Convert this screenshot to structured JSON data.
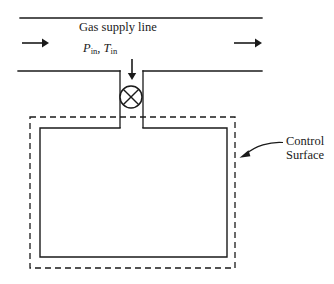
{
  "figure": {
    "type": "engineering-schematic",
    "background_color": "#ffffff",
    "line_color": "#1a1a1a"
  },
  "labels": {
    "supply_line": "Gas supply line",
    "inlet_pressure_symbol": "P",
    "inlet_pressure_subscript": "in",
    "symbol_separator": ", ",
    "inlet_temperature_symbol": "T",
    "inlet_temperature_subscript": "in",
    "control_surface_line1": "Control",
    "control_surface_line2": "Surface"
  },
  "elements": {
    "supply_pipe": {
      "name": "gas-supply-line-pipe",
      "top_wall_y": 18,
      "bottom_wall_y": 71,
      "x_start": 20,
      "x_end": 262,
      "neck_gap_x_start": 120,
      "neck_gap_x_end": 143
    },
    "flow_arrows": [
      {
        "name": "flow-arrow-left",
        "direction": "right",
        "x1": 22,
        "x2": 46,
        "y": 43
      },
      {
        "name": "flow-arrow-right",
        "direction": "right",
        "x1": 236,
        "x2": 261,
        "y": 43
      }
    ],
    "inlet_arrow": {
      "name": "inlet-flow-arrow-down",
      "direction": "down",
      "x": 132,
      "y1": 59,
      "y2": 78
    },
    "valve": {
      "name": "valve-symbol",
      "shape": "circle-with-x",
      "center_x": 131,
      "center_y": 97,
      "radius": 11
    },
    "neck": {
      "name": "tank-inlet-neck",
      "left_x": 120,
      "right_x": 143,
      "y_top": 71,
      "y_bottom": 128
    },
    "tank": {
      "name": "rigid-tank",
      "left_x": 40,
      "right_x": 227,
      "top_y": 128,
      "bottom_y": 257,
      "fill": "#ffffff"
    },
    "control_surface": {
      "name": "control-surface-boundary",
      "style": "dashed",
      "left_x": 30,
      "right_x": 235,
      "top_y": 117,
      "bottom_y": 268
    },
    "control_surface_pointer": {
      "name": "control-surface-leader-arrow",
      "from_x": 283,
      "from_y": 143,
      "to_x": 240,
      "to_y": 157
    }
  }
}
